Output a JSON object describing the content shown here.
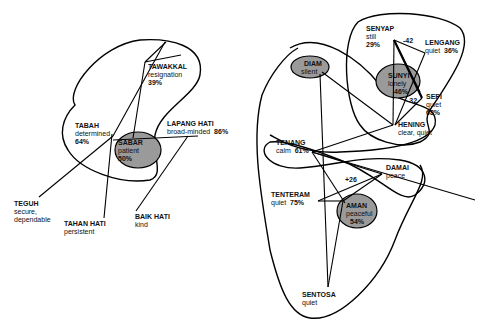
{
  "diagrams": [
    {
      "id": "left-cluster",
      "center": {
        "term": "SABAR",
        "gloss": "patient",
        "pct": "50%"
      },
      "nodes": [
        {
          "term": "TAWAKKAL",
          "gloss": "resignation",
          "pct": "39%"
        },
        {
          "term": "TABAH",
          "gloss": "determined",
          "pct": "64%"
        },
        {
          "term": "LAPANG HATI",
          "gloss": "broad-minded",
          "pct": "86%"
        },
        {
          "term": "SABAR",
          "gloss": "patient",
          "pct": "50%"
        },
        {
          "term": "TEGUH",
          "gloss": "secure,",
          "gloss2": "dependable"
        },
        {
          "term": "TAHAN HATI",
          "gloss": "persistent"
        },
        {
          "term": "BAIK HATI",
          "gloss": "kind"
        }
      ]
    },
    {
      "id": "right-cluster",
      "nodes": [
        {
          "term": "SENYAP",
          "gloss": "still",
          "pct": "29%"
        },
        {
          "term": "LENGANG",
          "gloss": "quiet",
          "pct": "36%"
        },
        {
          "term": "SUNYI",
          "gloss": "lonely",
          "pct": "46%"
        },
        {
          "term": "SEPI",
          "gloss": "quiet",
          "pct": "68%"
        },
        {
          "term": "DIAM",
          "gloss": "silent"
        },
        {
          "term": "HENING",
          "gloss": "clear, quiet"
        },
        {
          "term": "TENANG",
          "gloss": "calm",
          "pct": "61%"
        },
        {
          "term": "DAMAI",
          "gloss": "peace"
        },
        {
          "term": "TENTERAM",
          "gloss": "quiet",
          "pct": "75%"
        },
        {
          "term": "AMAN",
          "gloss": "peaceful",
          "pct": "54%"
        },
        {
          "term": "SENTOSA",
          "gloss": "quiet"
        }
      ],
      "edge_weights": [
        "-42",
        "-32",
        "+26"
      ]
    }
  ]
}
